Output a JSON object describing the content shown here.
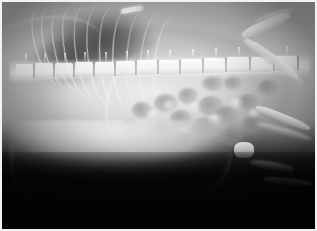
{
  "image": {
    "modality": "radiograph",
    "view": "right lateral",
    "subject": "small animal (feline / small canine) abdomen and caudal thorax",
    "title": "Lateral abdominal radiograph",
    "border_color": "#f2f2f2",
    "background_color": "#050505",
    "width": 317,
    "height": 231
  },
  "anatomy": {
    "regions": [
      {
        "name": "thorax-lung-field",
        "label": "Lung field",
        "tone": "radiolucent-dark"
      },
      {
        "name": "rib-cage",
        "label": "Ribs",
        "tone": "radiopaque-bright",
        "count": 11
      },
      {
        "name": "vertebral-column",
        "label": "Vertebral column",
        "tone": "radiopaque-bright",
        "vertebrae": 13
      },
      {
        "name": "diaphragm",
        "label": "Diaphragmatic line",
        "tone": "soft-tissue-opacity"
      },
      {
        "name": "abdomen-bowel-gas",
        "label": "Mottled intestinal gas pattern",
        "tone": "mixed-mottled"
      },
      {
        "name": "ventral-abdominal-wall",
        "label": "Ventral abdominal contour",
        "tone": "soft-tissue-edge"
      },
      {
        "name": "pelvis",
        "label": "Pelvis / ilium",
        "tone": "radiopaque-bright"
      },
      {
        "name": "hind-limb",
        "label": "Hind limb (femur, tibia)",
        "tone": "radiopaque-bright"
      },
      {
        "name": "scapula",
        "label": "Scapula / shoulder",
        "tone": "radiopaque-bright"
      }
    ],
    "marker": {
      "name": "metallic-marker",
      "label": "Radiopaque metallic marker",
      "position": "dorsal cranial thorax",
      "color": "#ffffff"
    }
  },
  "ribs": [
    {
      "left": 33,
      "top": 6,
      "w": 26,
      "h": 78,
      "rot": -20
    },
    {
      "left": 42,
      "top": 5,
      "w": 27,
      "h": 82,
      "rot": -18
    },
    {
      "left": 52,
      "top": 4,
      "w": 28,
      "h": 86,
      "rot": -16
    },
    {
      "left": 62,
      "top": 4,
      "w": 29,
      "h": 90,
      "rot": -14
    },
    {
      "left": 73,
      "top": 4,
      "w": 30,
      "h": 94,
      "rot": -12
    },
    {
      "left": 85,
      "top": 4,
      "w": 31,
      "h": 98,
      "rot": -10
    },
    {
      "left": 97,
      "top": 5,
      "w": 32,
      "h": 100,
      "rot": -7
    },
    {
      "left": 110,
      "top": 6,
      "w": 32,
      "h": 101,
      "rot": -4
    },
    {
      "left": 124,
      "top": 8,
      "w": 31,
      "h": 100,
      "rot": -1
    },
    {
      "left": 138,
      "top": 10,
      "w": 29,
      "h": 96,
      "rot": 2
    },
    {
      "left": 152,
      "top": 14,
      "w": 26,
      "h": 88,
      "rot": 5
    }
  ],
  "vertebrae": [
    {
      "left": 14,
      "top": 62,
      "w": 17
    },
    {
      "left": 33,
      "top": 61,
      "w": 18
    },
    {
      "left": 53,
      "top": 61,
      "w": 18
    },
    {
      "left": 73,
      "top": 60,
      "w": 18
    },
    {
      "left": 93,
      "top": 60,
      "w": 19
    },
    {
      "left": 114,
      "top": 59,
      "w": 19
    },
    {
      "left": 135,
      "top": 58,
      "w": 20
    },
    {
      "left": 157,
      "top": 58,
      "w": 20
    },
    {
      "left": 179,
      "top": 57,
      "w": 21
    },
    {
      "left": 202,
      "top": 56,
      "w": 21
    },
    {
      "left": 225,
      "top": 55,
      "w": 22
    },
    {
      "left": 249,
      "top": 55,
      "w": 22
    },
    {
      "left": 273,
      "top": 54,
      "w": 22
    }
  ],
  "gas_bubbles": [
    {
      "left": 152,
      "top": 92,
      "w": 24,
      "h": 18
    },
    {
      "left": 176,
      "top": 86,
      "w": 20,
      "h": 16
    },
    {
      "left": 196,
      "top": 94,
      "w": 26,
      "h": 20
    },
    {
      "left": 168,
      "top": 108,
      "w": 22,
      "h": 17
    },
    {
      "left": 190,
      "top": 116,
      "w": 25,
      "h": 19
    },
    {
      "left": 214,
      "top": 104,
      "w": 22,
      "h": 18
    },
    {
      "left": 218,
      "top": 126,
      "w": 24,
      "h": 18
    },
    {
      "left": 150,
      "top": 120,
      "w": 20,
      "h": 15
    },
    {
      "left": 236,
      "top": 92,
      "w": 20,
      "h": 16
    },
    {
      "left": 240,
      "top": 114,
      "w": 22,
      "h": 17
    },
    {
      "left": 200,
      "top": 74,
      "w": 22,
      "h": 15
    },
    {
      "left": 172,
      "top": 132,
      "w": 22,
      "h": 16
    },
    {
      "left": 130,
      "top": 100,
      "w": 20,
      "h": 16
    },
    {
      "left": 256,
      "top": 78,
      "w": 20,
      "h": 15
    },
    {
      "left": 118,
      "top": 118,
      "w": 19,
      "h": 14
    },
    {
      "left": 222,
      "top": 74,
      "w": 18,
      "h": 14
    }
  ],
  "gas_highlights": [
    {
      "left": 160,
      "top": 98,
      "w": 14,
      "h": 11
    },
    {
      "left": 186,
      "top": 100,
      "w": 13,
      "h": 10
    },
    {
      "left": 206,
      "top": 112,
      "w": 15,
      "h": 11
    },
    {
      "left": 228,
      "top": 96,
      "w": 13,
      "h": 10
    },
    {
      "left": 176,
      "top": 122,
      "w": 14,
      "h": 10
    },
    {
      "left": 246,
      "top": 106,
      "w": 13,
      "h": 10
    },
    {
      "left": 144,
      "top": 108,
      "w": 12,
      "h": 9
    }
  ],
  "bones": [
    {
      "name": "ilium",
      "left": 238,
      "top": 18,
      "w": 52,
      "h": 11,
      "rot": -24
    },
    {
      "name": "ilium-wing",
      "left": 252,
      "top": 10,
      "w": 40,
      "h": 9,
      "rot": -18
    },
    {
      "name": "femur",
      "left": 236,
      "top": 52,
      "w": 66,
      "h": 10,
      "rot": 36
    },
    {
      "name": "femur-2",
      "left": 246,
      "top": 58,
      "w": 62,
      "h": 8,
      "rot": 40
    },
    {
      "name": "tibia",
      "left": 252,
      "top": 112,
      "w": 58,
      "h": 8,
      "rot": 22
    },
    {
      "name": "tibia-2",
      "left": 254,
      "top": 126,
      "w": 56,
      "h": 7,
      "rot": 16
    },
    {
      "name": "stifle",
      "left": 232,
      "top": 140,
      "w": 20,
      "h": 16,
      "rot": 0
    },
    {
      "name": "tarsus",
      "left": 248,
      "top": 160,
      "w": 44,
      "h": 8,
      "rot": 10
    },
    {
      "name": "metatarsus",
      "left": 262,
      "top": 176,
      "w": 48,
      "h": 7,
      "rot": 6
    }
  ]
}
